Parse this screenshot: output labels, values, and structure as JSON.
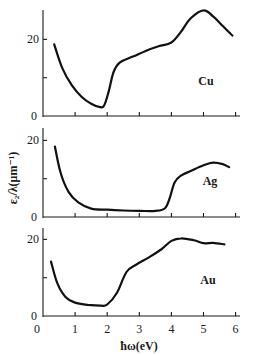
{
  "chart_data": {
    "type": "line",
    "title": "",
    "xlabel": "ħω(eV)",
    "ylabel": "ε₂/λ(μm⁻¹)",
    "xlim": [
      0,
      6.3
    ],
    "x_ticks": [
      "0",
      "1",
      "2",
      "3",
      "4",
      "5",
      "6"
    ],
    "y_ticks": [
      "0",
      "20"
    ],
    "grid": false,
    "legend": "none (panels labeled in-plot)",
    "panels": [
      {
        "label": "Cu",
        "ylim": [
          0,
          28
        ],
        "x": [
          0.35,
          0.6,
          0.9,
          1.2,
          1.5,
          1.75,
          1.9,
          2.05,
          2.2,
          2.4,
          2.8,
          3.2,
          3.6,
          4.0,
          4.3,
          4.6,
          5.0,
          5.3,
          5.6,
          5.9
        ],
        "y": [
          18.7,
          12.5,
          8.0,
          5.0,
          3.2,
          2.4,
          2.7,
          6.5,
          11.5,
          14.0,
          15.5,
          17.0,
          18.2,
          19.2,
          22.0,
          25.5,
          27.6,
          26.0,
          23.5,
          21.0
        ]
      },
      {
        "label": "Ag",
        "ylim": [
          0,
          20
        ],
        "x": [
          0.37,
          0.55,
          0.8,
          1.1,
          1.5,
          2.0,
          2.5,
          3.0,
          3.5,
          3.8,
          3.95,
          4.1,
          4.3,
          4.6,
          5.0,
          5.3,
          5.6,
          5.8
        ],
        "y": [
          18.4,
          11.5,
          6.5,
          3.8,
          2.2,
          1.9,
          1.7,
          1.6,
          1.6,
          2.3,
          5.0,
          9.0,
          10.8,
          12.0,
          13.5,
          14.2,
          13.8,
          13.0
        ]
      },
      {
        "label": "Au",
        "ylim": [
          0,
          20
        ],
        "x": [
          0.25,
          0.45,
          0.7,
          1.0,
          1.4,
          1.8,
          2.0,
          2.3,
          2.6,
          2.9,
          3.3,
          3.7,
          4.0,
          4.3,
          4.7,
          5.0,
          5.3,
          5.65
        ],
        "y": [
          14.2,
          8.5,
          5.0,
          3.5,
          2.9,
          2.7,
          3.0,
          6.0,
          11.5,
          13.4,
          15.3,
          17.5,
          19.6,
          20.3,
          19.8,
          19.0,
          19.1,
          18.7
        ]
      }
    ]
  }
}
